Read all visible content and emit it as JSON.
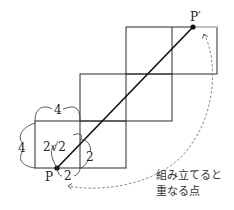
{
  "diagram": {
    "point_start": {
      "label": "P",
      "x": 57,
      "y": 168
    },
    "point_end": {
      "label": "P′",
      "x": 193,
      "y": 27
    },
    "dim_top": "4",
    "dim_left": "4",
    "dim_diag": "2√2",
    "dim_right_small": "2",
    "dim_bottom_small": "2",
    "note_line1": "組み立てると",
    "note_line2": "重なる点",
    "colors": {
      "line": "#2a2a2a",
      "dashed": "#777777",
      "point": "#111111"
    }
  }
}
